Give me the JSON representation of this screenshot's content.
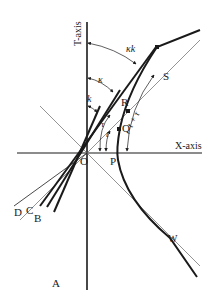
{
  "diagram": {
    "type": "spacetime-diagram",
    "axes": {
      "t_axis_label": "T-axis",
      "x_axis_label": "X-axis"
    },
    "points": {
      "origin": "O",
      "p": "P",
      "q": "Q",
      "r": "R",
      "s": "S",
      "w": "W",
      "a": "A",
      "b": "B",
      "c": "C",
      "d": "D"
    },
    "angle_labels": {
      "kappa_k": "κk",
      "kappa": "κ",
      "k": "k",
      "tau": "τ",
      "t": "t",
      "t_plus_tau": "t + τ"
    },
    "colors": {
      "ink": "#1a1a1a",
      "thin_line": "#555555",
      "background": "#ffffff"
    }
  }
}
